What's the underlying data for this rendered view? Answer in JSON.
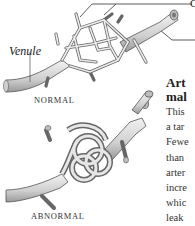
{
  "diagram": {
    "labels": {
      "venule": "Venule",
      "normal_caption": "NORMAL",
      "abnormal_caption": "ABNORMAL",
      "top_right_partial": "C"
    },
    "side_text": {
      "heading_lines": [
        "Art",
        "mal"
      ],
      "body_lines": [
        "This",
        "a tar",
        "Fewe",
        "than",
        "arter",
        "incre",
        "whic",
        "leak",
        "the s"
      ]
    },
    "colors": {
      "vessel_fill": "#d9d9d9",
      "vessel_stroke": "#555555",
      "leader_line": "#333333",
      "background": "#ffffff"
    }
  }
}
